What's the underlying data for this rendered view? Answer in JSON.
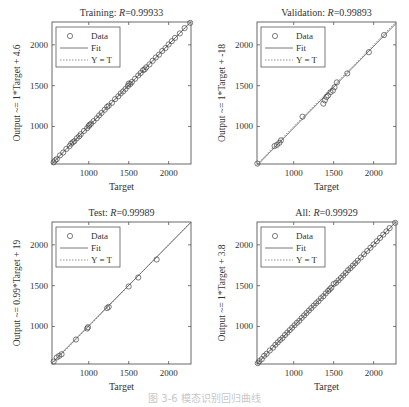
{
  "caption": "图 3-6 模态识别回归曲线",
  "legend": {
    "data": "Data",
    "fit": "Fit",
    "yt": "Y = T"
  },
  "xlabel": "Target",
  "chart_data": [
    {
      "type": "scatter",
      "title": "Training: R=0.99933",
      "title_prefix": "Training: ",
      "r_label": "R",
      "r_value": "=0.99933",
      "xlabel": "Target",
      "ylabel": "Output ~= 1*Target + 4.6",
      "xlim": [
        540,
        2280
      ],
      "ylim": [
        540,
        2280
      ],
      "xticks": [
        1000,
        1500,
        2000
      ],
      "yticks": [
        1000,
        1500,
        2000
      ],
      "fit": {
        "slope": 1,
        "intercept": 4.6
      },
      "series": [
        {
          "name": "Data",
          "x": [
            560,
            580,
            600,
            640,
            680,
            720,
            760,
            780,
            800,
            820,
            850,
            880,
            900,
            940,
            980,
            1000,
            1010,
            1030,
            1060,
            1100,
            1130,
            1160,
            1200,
            1230,
            1250,
            1290,
            1330,
            1370,
            1400,
            1430,
            1460,
            1490,
            1500,
            1520,
            1540,
            1580,
            1620,
            1650,
            1680,
            1700,
            1720,
            1760,
            1800,
            1840,
            1880,
            1920,
            1960,
            2000,
            2040,
            2080,
            2140,
            2200,
            2270
          ],
          "y": [
            560,
            585,
            600,
            645,
            680,
            725,
            760,
            790,
            805,
            820,
            855,
            880,
            905,
            945,
            980,
            1005,
            1020,
            1035,
            1065,
            1100,
            1135,
            1165,
            1205,
            1240,
            1255,
            1290,
            1335,
            1370,
            1405,
            1430,
            1460,
            1495,
            1525,
            1520,
            1545,
            1585,
            1625,
            1655,
            1690,
            1700,
            1725,
            1760,
            1805,
            1845,
            1880,
            1925,
            1960,
            2005,
            2045,
            2085,
            2140,
            2205,
            2270
          ]
        }
      ]
    },
    {
      "type": "scatter",
      "title": "Validation: R=0.99893",
      "title_prefix": "Validation: ",
      "r_label": "R",
      "r_value": "=0.99893",
      "xlabel": "Target",
      "ylabel": "Output ~= 1*Target + -18",
      "xlim": [
        540,
        2280
      ],
      "ylim": [
        540,
        2280
      ],
      "xticks": [
        1000,
        1500,
        2000
      ],
      "yticks": [
        1000,
        1500,
        2000
      ],
      "fit": {
        "slope": 1,
        "intercept": -18
      },
      "series": [
        {
          "name": "Data",
          "x": [
            545,
            760,
            790,
            820,
            840,
            1110,
            1370,
            1390,
            1410,
            1430,
            1460,
            1490,
            1510,
            1540,
            1670,
            1940,
            2130
          ],
          "y": [
            545,
            760,
            775,
            800,
            830,
            1120,
            1280,
            1320,
            1360,
            1380,
            1420,
            1440,
            1480,
            1540,
            1650,
            1910,
            2120
          ]
        }
      ]
    },
    {
      "type": "scatter",
      "title": "Test: R=0.99989",
      "title_prefix": "Test: ",
      "r_label": "R",
      "r_value": "=0.99989",
      "xlabel": "Target",
      "ylabel": "Output ~= 0.99*Target + 19",
      "xlim": [
        540,
        2280
      ],
      "ylim": [
        540,
        2280
      ],
      "xticks": [
        1000,
        1500,
        2000
      ],
      "yticks": [
        1000,
        1500,
        2000
      ],
      "fit": {
        "slope": 0.99,
        "intercept": 19
      },
      "series": [
        {
          "name": "Data",
          "x": [
            560,
            600,
            630,
            660,
            840,
            980,
            990,
            1230,
            1250,
            1500,
            1620,
            1850
          ],
          "y": [
            570,
            620,
            640,
            660,
            840,
            975,
            990,
            1225,
            1240,
            1490,
            1600,
            1820
          ]
        }
      ]
    },
    {
      "type": "scatter",
      "title": "All: R=0.99929",
      "title_prefix": "All: ",
      "r_label": "R",
      "r_value": "=0.99929",
      "xlabel": "Target",
      "ylabel": "Output ~= 1*Target + 3.8",
      "xlim": [
        540,
        2280
      ],
      "ylim": [
        540,
        2280
      ],
      "xticks": [
        1000,
        1500,
        2000
      ],
      "yticks": [
        1000,
        1500,
        2000
      ],
      "fit": {
        "slope": 1,
        "intercept": 3.8
      },
      "series": [
        {
          "name": "Data",
          "x": [
            550,
            570,
            600,
            630,
            660,
            700,
            740,
            770,
            800,
            830,
            860,
            890,
            920,
            950,
            980,
            1010,
            1040,
            1070,
            1100,
            1130,
            1160,
            1190,
            1220,
            1250,
            1280,
            1310,
            1340,
            1370,
            1400,
            1430,
            1450,
            1470,
            1500,
            1530,
            1560,
            1590,
            1620,
            1650,
            1680,
            1710,
            1740,
            1770,
            1800,
            1840,
            1880,
            1920,
            1960,
            2000,
            2040,
            2080,
            2120,
            2160,
            2200,
            2270
          ],
          "y": [
            550,
            575,
            600,
            640,
            665,
            705,
            740,
            775,
            805,
            835,
            860,
            895,
            925,
            955,
            985,
            1015,
            1045,
            1070,
            1105,
            1135,
            1165,
            1195,
            1225,
            1255,
            1285,
            1310,
            1345,
            1370,
            1405,
            1435,
            1455,
            1475,
            1520,
            1535,
            1565,
            1595,
            1625,
            1655,
            1690,
            1715,
            1745,
            1775,
            1805,
            1845,
            1885,
            1925,
            1965,
            2005,
            2045,
            2085,
            2125,
            2165,
            2205,
            2270
          ]
        }
      ]
    }
  ]
}
